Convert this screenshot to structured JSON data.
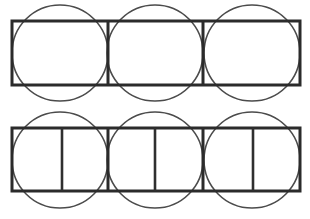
{
  "figure": {
    "canvas": {
      "width": 310,
      "height": 219,
      "background": "#ffffff"
    },
    "style": {
      "rect_stroke_color": "#2b2b2b",
      "rect_stroke_width": 3,
      "divider_stroke_color": "#2b2b2b",
      "divider_stroke_width": 3,
      "inner_divider_stroke_color": "#2f2f2f",
      "inner_divider_stroke_width": 2.6,
      "circle_stroke_color": "#4b4b4b",
      "circle_stroke_width": 1.6
    },
    "rows": [
      {
        "name": "top-row",
        "rect": {
          "x": 12,
          "y": 21,
          "width": 288,
          "height": 64
        },
        "dividers_x": [
          108,
          203
        ],
        "inner_dividers_x": [],
        "circles": [
          {
            "cx": 60,
            "cy": 53,
            "r": 48
          },
          {
            "cx": 155,
            "cy": 53,
            "r": 48
          },
          {
            "cx": 252,
            "cy": 53,
            "r": 48
          }
        ]
      },
      {
        "name": "bottom-row",
        "rect": {
          "x": 12,
          "y": 128,
          "width": 288,
          "height": 63
        },
        "dividers_x": [
          108,
          203
        ],
        "inner_dividers_x": [
          62,
          155,
          253
        ],
        "circles": [
          {
            "cx": 60,
            "cy": 160,
            "r": 48
          },
          {
            "cx": 155,
            "cy": 160,
            "r": 48
          },
          {
            "cx": 252,
            "cy": 160,
            "r": 48
          }
        ]
      }
    ]
  }
}
